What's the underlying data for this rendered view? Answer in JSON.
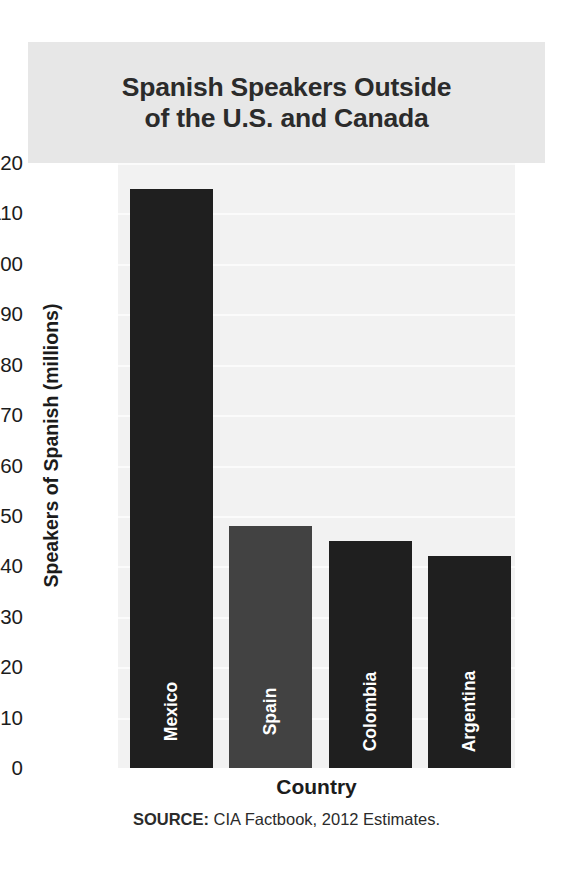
{
  "chart_data": {
    "type": "bar",
    "title": "Spanish Speakers Outside of the U.S. and Canada",
    "title_lines": [
      "Spanish Speakers Outside",
      "of the U.S. and Canada"
    ],
    "xlabel": "Country",
    "ylabel": "Speakers of Spanish (millions)",
    "categories": [
      "Mexico",
      "Spain",
      "Colombia",
      "Argentina"
    ],
    "values": [
      114.8,
      48,
      45,
      42
    ],
    "bar_colors": [
      "#1f1f1f",
      "#424242",
      "#1f1f1f",
      "#1f1f1f"
    ],
    "ylim": [
      0,
      120
    ],
    "ytick_step": 10,
    "yticks": [
      0,
      10,
      20,
      30,
      40,
      50,
      60,
      70,
      80,
      90,
      100,
      110,
      120
    ],
    "ytick_labels": [
      "0",
      "10",
      "20",
      "30",
      "40",
      "50",
      "60",
      "70",
      "80",
      "90",
      "100",
      "110",
      "120"
    ],
    "grid": true,
    "gridline_color": "#fbfbfb",
    "legend": null,
    "plot_background": "#f2f2f2",
    "title_background": "#e7e7e7",
    "bar_label_color": "#ffffff",
    "source_prefix": "SOURCE:",
    "source_text": " CIA Factbook, 2012 Estimates."
  }
}
